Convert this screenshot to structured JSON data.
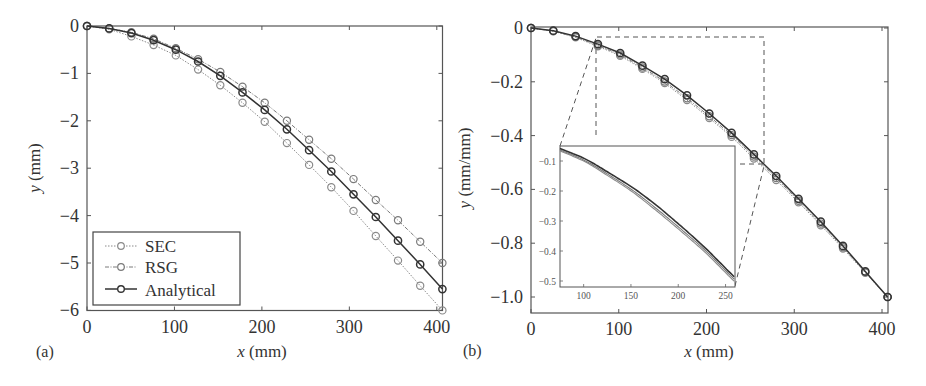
{
  "figure": {
    "panel_a_label": "(a)",
    "panel_b_label": "(b)"
  },
  "colors": {
    "analytical": "#333333",
    "sec": "#8a8a8a",
    "rsg": "#7a7a7a",
    "axis": "#555555",
    "dash": "#555555"
  },
  "chart_data": [
    {
      "type": "line",
      "panel": "(a)",
      "title": "",
      "xlabel": "x (mm)",
      "ylabel": "y (mm)",
      "xlim": [
        0,
        406.4
      ],
      "ylim": [
        -6,
        0
      ],
      "xticks": [
        0,
        100,
        200,
        300,
        400
      ],
      "yticks": [
        0,
        -1,
        -2,
        -3,
        -4,
        -5,
        -6
      ],
      "xtick_labels": [
        "0",
        "100",
        "200",
        "300",
        "400"
      ],
      "ytick_labels": [
        "0",
        "−1",
        "−2",
        "−3",
        "−4",
        "−5",
        "−6"
      ],
      "grid": false,
      "legend_position": "lower left",
      "x": [
        0,
        25.4,
        50.8,
        76.2,
        101.6,
        127,
        152.4,
        177.8,
        203.2,
        228.6,
        254,
        279.4,
        304.8,
        330.2,
        355.6,
        381,
        406.4
      ],
      "series": [
        {
          "name": "SEC",
          "style": "dotted",
          "marker": "o",
          "values": [
            0,
            -0.07,
            -0.22,
            -0.4,
            -0.62,
            -0.92,
            -1.25,
            -1.62,
            -2.02,
            -2.47,
            -2.93,
            -3.4,
            -3.9,
            -4.43,
            -4.95,
            -5.48,
            -6.0
          ]
        },
        {
          "name": "RSG",
          "style": "dashdot",
          "marker": "o",
          "values": [
            0,
            -0.05,
            -0.13,
            -0.27,
            -0.47,
            -0.7,
            -0.97,
            -1.28,
            -1.62,
            -2.0,
            -2.4,
            -2.8,
            -3.23,
            -3.67,
            -4.1,
            -4.55,
            -5.0
          ]
        },
        {
          "name": "Analytical",
          "style": "solid",
          "marker": "o",
          "values": [
            0,
            -0.05,
            -0.15,
            -0.3,
            -0.5,
            -0.75,
            -1.05,
            -1.4,
            -1.77,
            -2.18,
            -2.62,
            -3.07,
            -3.55,
            -4.03,
            -4.53,
            -5.03,
            -5.55
          ]
        }
      ]
    },
    {
      "type": "line",
      "panel": "(b)",
      "title": "",
      "xlabel": "x (mm)",
      "ylabel": "y (mm/mm)",
      "xlim": [
        0,
        406.4
      ],
      "ylim": [
        -1.055,
        0
      ],
      "xticks": [
        0,
        100,
        200,
        300,
        400
      ],
      "yticks": [
        0,
        -0.2,
        -0.4,
        -0.6,
        -0.8,
        -1.0
      ],
      "xtick_labels": [
        "0",
        "100",
        "200",
        "300",
        "400"
      ],
      "ytick_labels": [
        "0",
        "−0.2",
        "−0.4",
        "−0.6",
        "−0.8",
        "−1.0"
      ],
      "grid": false,
      "x": [
        0,
        25.4,
        50.8,
        76.2,
        101.6,
        127,
        152.4,
        177.8,
        203.2,
        228.6,
        254,
        279.4,
        304.8,
        330.2,
        355.6,
        381,
        406.4
      ],
      "series": [
        {
          "name": "SEC",
          "style": "dotted",
          "marker": "o",
          "values": [
            0,
            -0.012,
            -0.035,
            -0.068,
            -0.103,
            -0.152,
            -0.205,
            -0.268,
            -0.335,
            -0.405,
            -0.485,
            -0.565,
            -0.648,
            -0.733,
            -0.82,
            -0.91,
            -1.0
          ]
        },
        {
          "name": "RSG",
          "style": "dashdot",
          "marker": "o",
          "values": [
            0,
            -0.011,
            -0.033,
            -0.065,
            -0.099,
            -0.147,
            -0.199,
            -0.261,
            -0.328,
            -0.398,
            -0.478,
            -0.558,
            -0.642,
            -0.727,
            -0.815,
            -0.907,
            -1.0
          ]
        },
        {
          "name": "Analytical",
          "style": "solid",
          "marker": "o",
          "values": [
            0,
            -0.01,
            -0.03,
            -0.06,
            -0.093,
            -0.14,
            -0.19,
            -0.25,
            -0.318,
            -0.39,
            -0.47,
            -0.55,
            -0.635,
            -0.72,
            -0.81,
            -0.905,
            -1.0
          ]
        }
      ],
      "inset": {
        "xlim": [
          75,
          260
        ],
        "ylim": [
          -0.52,
          -0.05
        ],
        "xticks": [
          100,
          150,
          200,
          250
        ],
        "yticks": [
          -0.1,
          -0.2,
          -0.3,
          -0.4,
          -0.5
        ],
        "xtick_labels": [
          "100",
          "150",
          "200",
          "250"
        ],
        "ytick_labels": [
          "−0.1",
          "−0.2",
          "−0.3",
          "−0.4",
          "−0.5"
        ],
        "zoom_region": {
          "x": [
            76.2,
            265
          ],
          "y": [
            -0.5,
            -0.04
          ]
        }
      }
    }
  ],
  "legend": {
    "items": [
      {
        "label": "SEC"
      },
      {
        "label": "RSG"
      },
      {
        "label": "Analytical"
      }
    ]
  }
}
